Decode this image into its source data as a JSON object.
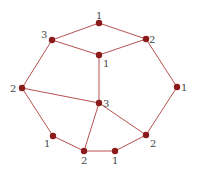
{
  "diagram": {
    "type": "graph",
    "colors": {
      "node": "#8b1a1a",
      "edge": "#b5524f",
      "label": "#444444"
    },
    "nodes": [
      {
        "id": "n0",
        "x": 99,
        "y": 23,
        "label": "1",
        "lx": 96,
        "ly": 19
      },
      {
        "id": "n1",
        "x": 52,
        "y": 40,
        "label": "3",
        "lx": 41,
        "ly": 38
      },
      {
        "id": "n2",
        "x": 146,
        "y": 39,
        "label": "2",
        "lx": 149,
        "ly": 43
      },
      {
        "id": "n3",
        "x": 99,
        "y": 55,
        "label": "1",
        "lx": 103,
        "ly": 67
      },
      {
        "id": "n4",
        "x": 22,
        "y": 88,
        "label": "2",
        "lx": 10,
        "ly": 92
      },
      {
        "id": "n5",
        "x": 177,
        "y": 87,
        "label": "1",
        "lx": 181,
        "ly": 91
      },
      {
        "id": "n6",
        "x": 99,
        "y": 103,
        "label": "3",
        "lx": 103,
        "ly": 107
      },
      {
        "id": "n7",
        "x": 53,
        "y": 136,
        "label": "1",
        "lx": 44,
        "ly": 147
      },
      {
        "id": "n8",
        "x": 146,
        "y": 135,
        "label": "2",
        "lx": 150,
        "ly": 147
      },
      {
        "id": "n9",
        "x": 84,
        "y": 151,
        "label": "2",
        "lx": 81,
        "ly": 164
      },
      {
        "id": "n10",
        "x": 115,
        "y": 151,
        "label": "1",
        "lx": 112,
        "ly": 164
      }
    ],
    "edges": [
      [
        "n0",
        "n1"
      ],
      [
        "n0",
        "n2"
      ],
      [
        "n1",
        "n3"
      ],
      [
        "n2",
        "n3"
      ],
      [
        "n1",
        "n4"
      ],
      [
        "n2",
        "n5"
      ],
      [
        "n3",
        "n6"
      ],
      [
        "n4",
        "n6"
      ],
      [
        "n4",
        "n7"
      ],
      [
        "n5",
        "n8"
      ],
      [
        "n6",
        "n8"
      ],
      [
        "n6",
        "n9"
      ],
      [
        "n7",
        "n9"
      ],
      [
        "n9",
        "n10"
      ],
      [
        "n10",
        "n8"
      ]
    ]
  }
}
